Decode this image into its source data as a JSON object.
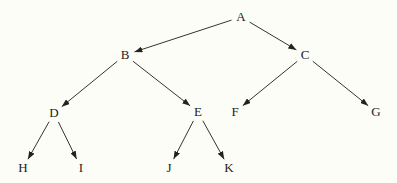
{
  "diagram": {
    "type": "binary-tree",
    "nodes": [
      {
        "id": "A",
        "label": "A"
      },
      {
        "id": "B",
        "label": "B"
      },
      {
        "id": "C",
        "label": "C"
      },
      {
        "id": "D",
        "label": "D"
      },
      {
        "id": "E",
        "label": "E"
      },
      {
        "id": "F",
        "label": "F"
      },
      {
        "id": "G",
        "label": "G"
      },
      {
        "id": "H",
        "label": "H"
      },
      {
        "id": "I",
        "label": "I"
      },
      {
        "id": "J",
        "label": "J"
      },
      {
        "id": "K",
        "label": "K"
      }
    ],
    "edges": [
      {
        "from": "A",
        "to": "B"
      },
      {
        "from": "A",
        "to": "C"
      },
      {
        "from": "B",
        "to": "D"
      },
      {
        "from": "B",
        "to": "E"
      },
      {
        "from": "C",
        "to": "F"
      },
      {
        "from": "C",
        "to": "G"
      },
      {
        "from": "D",
        "to": "H"
      },
      {
        "from": "D",
        "to": "I"
      },
      {
        "from": "E",
        "to": "J"
      },
      {
        "from": "E",
        "to": "K"
      }
    ],
    "colors": {
      "background": "#fdfdf8",
      "ink": "#222222"
    }
  }
}
